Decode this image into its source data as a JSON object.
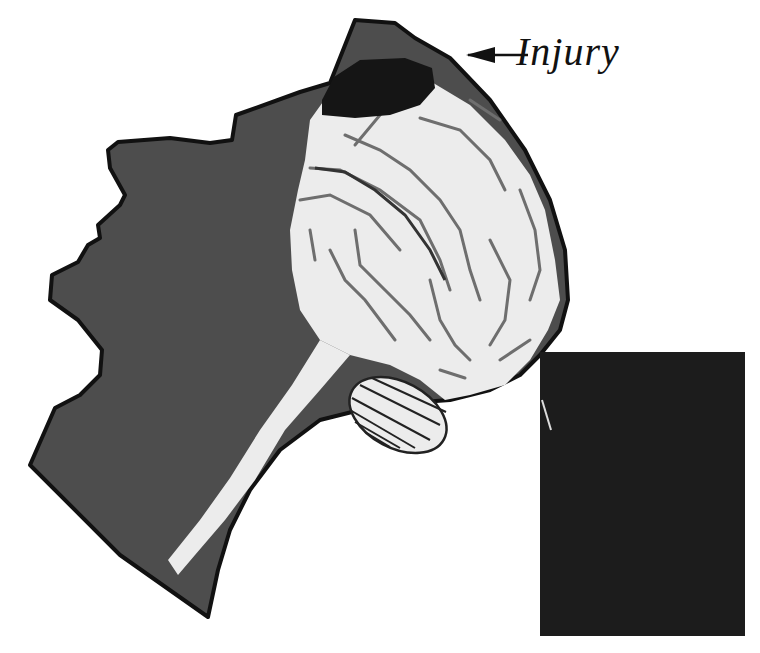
{
  "figure": {
    "type": "anatomical-diagram",
    "labels": [
      {
        "id": "injury",
        "text": "Injury",
        "points_to": "dark lesion at top of skull"
      }
    ],
    "parts": [
      "head-silhouette",
      "cerebrum",
      "injury-lesion",
      "brainstem-spinal-cord",
      "cerebellum",
      "black-panel"
    ]
  },
  "colors": {
    "background": "#ffffff",
    "head_fill": "#4d4d4d",
    "outline": "#111111",
    "brain_fill": "#ececec",
    "sulci": "#6e6e6e",
    "injury": "#151515",
    "panel": "#1c1c1c"
  }
}
